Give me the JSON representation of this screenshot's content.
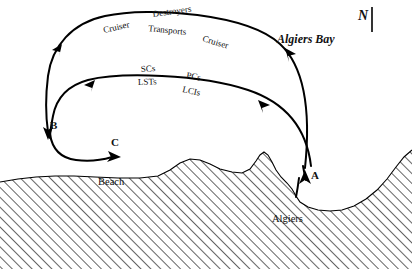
{
  "figure": {
    "background_color": "#ffffff",
    "ink_color": "#000000"
  },
  "compass": {
    "label": "N",
    "name": "north-indicator"
  },
  "water": {
    "bay_label": "Algiers Bay"
  },
  "land": {
    "beach_label": "Beach",
    "city_label": "Algiers",
    "hatch_angle_deg": 45,
    "hatch_color": "#111111"
  },
  "landing_points": [
    {
      "id": "A",
      "label": "A"
    },
    {
      "id": "B",
      "label": "B"
    },
    {
      "id": "C",
      "label": "C"
    }
  ],
  "routes": [
    {
      "id": "outer",
      "name": "outer-convoy-route",
      "upper_labels": [
        "Destroyers"
      ],
      "lower_labels": [
        "Cruiser",
        "Transports",
        "Cruiser"
      ]
    },
    {
      "id": "inner",
      "name": "inner-convoy-route",
      "upper_labels": [
        "SCs",
        "PCs"
      ],
      "lower_labels": [
        "LSTs",
        "LCIs"
      ]
    },
    {
      "id": "beach-approach",
      "name": "beach-approach-route",
      "upper_labels": [],
      "lower_labels": []
    }
  ],
  "unit_labels": {
    "destroyers": "Destroyers",
    "cruiser_left": "Cruiser",
    "transports": "Transports",
    "cruiser_right": "Cruiser",
    "scs": "SCs",
    "lsts": "LSTs",
    "pcs": "PCs",
    "lcis": "LCIs"
  }
}
